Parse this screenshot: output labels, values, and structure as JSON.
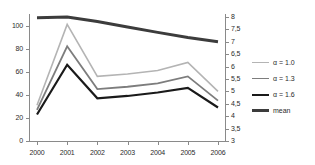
{
  "chart_data": {
    "type": "line",
    "title": "",
    "xlabel": "",
    "ylabel": "",
    "categories": [
      "2000",
      "2001",
      "2002",
      "2003",
      "2004",
      "2005",
      "2006"
    ],
    "x_tick_labels": [
      "2000",
      "2001",
      "2002",
      "2003",
      "2004",
      "2005",
      "2006"
    ],
    "y_left_tick_labels": [
      "0",
      "20",
      "40",
      "60",
      "80",
      "100"
    ],
    "y_left_tick_values": [
      0,
      20,
      40,
      60,
      80,
      100
    ],
    "ylim": [
      0,
      110
    ],
    "y_right_tick_labels": [
      "3",
      "3,5",
      "4",
      "4,5",
      "5",
      "5,5",
      "6",
      "6,5",
      "7",
      "7,5",
      "8"
    ],
    "y_right_tick_values": [
      3,
      3.5,
      4,
      4.5,
      5,
      5.5,
      6,
      6.5,
      7,
      7.5,
      8
    ],
    "y_right_lim": [
      3,
      8
    ],
    "grid": false,
    "legend_position": "right",
    "series": [
      {
        "name": "α = 1.0",
        "axis": "left",
        "color": "#b4b4b4",
        "width": 1.6,
        "values": [
          31,
          101,
          56,
          58,
          61,
          68,
          43
        ]
      },
      {
        "name": "α = 1.3",
        "axis": "left",
        "color": "#7d7d7d",
        "width": 1.8,
        "values": [
          27,
          82,
          45,
          47,
          50,
          56,
          35
        ]
      },
      {
        "name": "α = 1.6",
        "axis": "left",
        "color": "#1a1a1a",
        "width": 2.2,
        "values": [
          23,
          66,
          37,
          39,
          42,
          46,
          29
        ]
      },
      {
        "name": "mean",
        "axis": "right",
        "color": "#3c3c3c",
        "width": 3.0,
        "values": [
          7.97,
          8.0,
          7.82,
          7.6,
          7.38,
          7.17,
          7.0
        ]
      }
    ]
  },
  "legend": {
    "items": [
      {
        "label": "α = 1.0",
        "color": "#b4b4b4"
      },
      {
        "label": "α = 1.3",
        "color": "#7d7d7d"
      },
      {
        "label": "α = 1.6",
        "color": "#1a1a1a"
      },
      {
        "label": "mean",
        "color": "#3c3c3c"
      }
    ]
  }
}
